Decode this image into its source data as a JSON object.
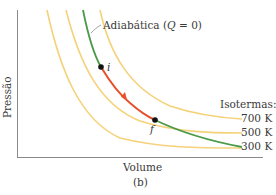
{
  "figure": {
    "panel_label": "(b)",
    "x_axis_label": "Volume",
    "y_axis_label": "Pressão",
    "adiabat_label": "Adiabática (Q = 0)",
    "adiabat_label_parts": {
      "prefix": "Adiabática (",
      "q": "Q",
      "suffix": " = 0)"
    },
    "isotherm_legend_title": "Isotermas:",
    "isotherms": [
      {
        "label": "700 K",
        "color": "#f5d27a"
      },
      {
        "label": "500 K",
        "color": "#f5d27a"
      },
      {
        "label": "300 K",
        "color": "#f5d27a"
      }
    ],
    "points": {
      "initial": "i",
      "final": "f"
    },
    "colors": {
      "isotherm": "#f5d27a",
      "adiabat": "#4a9a48",
      "process": "#e8502a",
      "axis": "#8a8a8a",
      "point": "#111111"
    }
  }
}
